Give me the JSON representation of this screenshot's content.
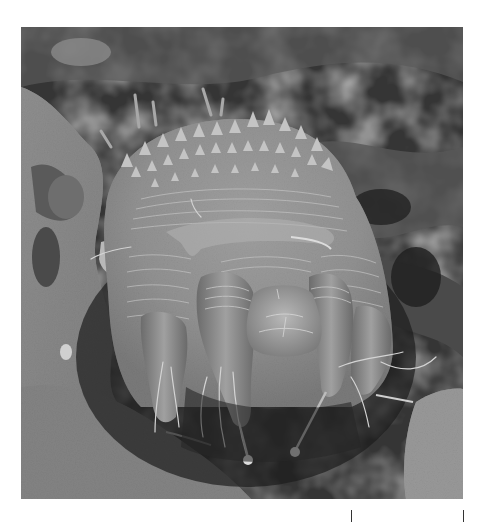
{
  "figure": {
    "alt": "Grayscale SEM image of a mite emerging from debris, showing spiny dorsum, striated cuticle, legs with setae and sucker-tipped pedicels",
    "colors": {
      "background": "#ffffff",
      "image_dark": "#2e2e2e",
      "image_mid": "#7a7a7a",
      "image_light": "#c8c8c8"
    }
  },
  "scale_bar": {
    "label": "",
    "left_tick_x": 351,
    "right_tick_x": 463
  }
}
